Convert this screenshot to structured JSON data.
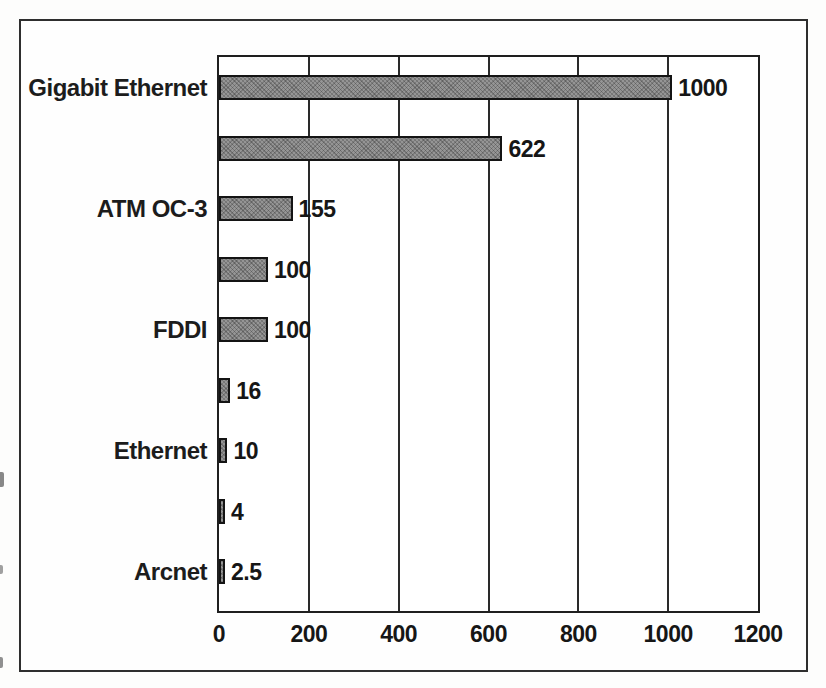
{
  "figure": {
    "background_color": "#fdfdfc",
    "frame_border_color": "#2e2e2e"
  },
  "chart_data": {
    "type": "bar",
    "orientation": "horizontal",
    "title": "",
    "xlabel": "",
    "ylabel": "",
    "xlim": [
      0,
      1200
    ],
    "x_ticks": [
      0,
      200,
      400,
      600,
      800,
      1000,
      1200
    ],
    "x_tick_labels": [
      "0",
      "200",
      "400",
      "600",
      "800",
      "1000",
      "1200"
    ],
    "grid": "vertical gridlines at each x tick, bars drawn over gridlines",
    "legend": "none",
    "bar_fill_color": "#959595",
    "bar_fill_texture": "halftone-stipple",
    "bar_border_color": "#141414",
    "rows": [
      {
        "label": "Gigabit Ethernet",
        "value": 1000,
        "value_label": "1000"
      },
      {
        "label": "",
        "value": 622,
        "value_label": "622"
      },
      {
        "label": "ATM OC-3",
        "value": 155,
        "value_label": "155"
      },
      {
        "label": "",
        "value": 100,
        "value_label": "100"
      },
      {
        "label": "FDDI",
        "value": 100,
        "value_label": "100"
      },
      {
        "label": "",
        "value": 16,
        "value_label": "16"
      },
      {
        "label": "Ethernet",
        "value": 10,
        "value_label": "10"
      },
      {
        "label": "",
        "value": 4,
        "value_label": "4"
      },
      {
        "label": "Arcnet",
        "value": 2.5,
        "value_label": "2.5"
      }
    ]
  }
}
